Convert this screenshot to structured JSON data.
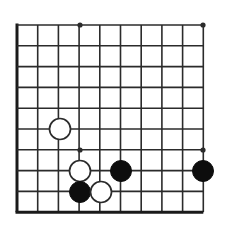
{
  "figure": {
    "kind": "go-board-diagram",
    "background_color": "#ffffff",
    "line_color": "#2b2b2b",
    "edge_color": "#1a1a1a",
    "black_stone_color": "#0d0d0d",
    "white_stone_fill": "#ffffff",
    "white_stone_outline": "#2b2b2b"
  },
  "board": {
    "columns": 10,
    "rows": 10,
    "origin_x": 17,
    "origin_y": 25,
    "spacing_x": 20.7,
    "spacing_y": 20.8,
    "line_width": 1.6,
    "edge_line_width": 3.0,
    "edges": [
      "left",
      "bottom"
    ],
    "star_point_radius": 2.6,
    "star_points": [
      {
        "name": "top-left-hoshi",
        "col": 3,
        "row": 0,
        "x": 80,
        "y": 25
      },
      {
        "name": "top-right-hoshi",
        "col": 9,
        "row": 0,
        "x": 203,
        "y": 25
      },
      {
        "name": "bottom-left-hoshi",
        "col": 3,
        "row": 6,
        "x": 80,
        "y": 150
      },
      {
        "name": "bottom-right-hoshi",
        "col": 9,
        "row": 6,
        "x": 203,
        "y": 150
      }
    ]
  },
  "stones": {
    "radius": 10.5,
    "items": [
      {
        "id": "stone-1",
        "color": "white",
        "col": 2,
        "row": 5,
        "x": 60,
        "y": 129
      },
      {
        "id": "stone-2",
        "color": "white",
        "col": 3,
        "row": 7,
        "x": 80,
        "y": 171
      },
      {
        "id": "stone-3",
        "color": "black",
        "col": 3,
        "row": 8,
        "x": 80,
        "y": 192
      },
      {
        "id": "stone-4",
        "color": "white",
        "col": 4,
        "row": 8,
        "x": 101,
        "y": 192
      },
      {
        "id": "stone-5",
        "color": "black",
        "col": 5,
        "row": 7,
        "x": 121,
        "y": 171
      },
      {
        "id": "stone-6",
        "color": "black",
        "col": 9,
        "row": 7,
        "x": 203,
        "y": 171
      }
    ]
  }
}
